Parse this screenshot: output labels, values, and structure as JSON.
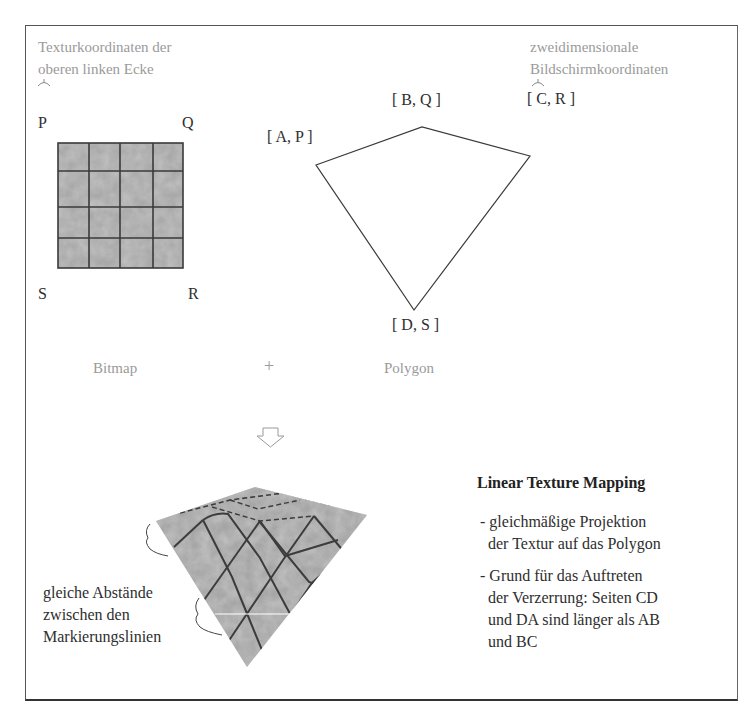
{
  "diagram": {
    "top_left_caption": [
      "Texturkoordinaten der",
      "oberen linken Ecke"
    ],
    "top_right_caption": [
      "zweidimensionale",
      "Bildschirmkoordinaten"
    ],
    "bitmap": {
      "corner_labels": {
        "top_left": "P",
        "top_right": "Q",
        "bottom_left": "S",
        "bottom_right": "R"
      },
      "grid_rows": 4,
      "grid_cols": 4,
      "caption": "Bitmap"
    },
    "plus_sign": "+",
    "polygon": {
      "vertex_labels": {
        "a": "[ A, P ]",
        "b": "[ B, Q ]",
        "c": "[ C, R ]",
        "d": "[ D, S ]"
      },
      "caption": "Polygon"
    },
    "result": {
      "side_note": [
        "gleiche Abstände",
        "zwischen den",
        "Markierungslinien"
      ]
    },
    "explanation": {
      "title": "Linear Texture Mapping",
      "bullets": [
        {
          "lines": [
            "- gleichmäßige Projektion",
            "  der Textur auf das Polygon"
          ]
        },
        {
          "lines": [
            "- Grund für das Auftreten",
            "  der Verzerrung: Seiten CD",
            "  und DA sind länger als AB",
            "  und BC"
          ]
        }
      ]
    },
    "colors": {
      "texture_fill": "#a8a8a8",
      "grid_line": "#3a3a3a",
      "caption_gray": "#9a9a9a",
      "frame": "#555555"
    }
  }
}
